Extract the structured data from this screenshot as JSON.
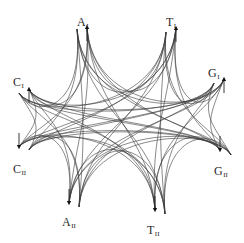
{
  "diagram": {
    "type": "network-of-curved-connections",
    "stroke_color": "#3a3a3a",
    "background": "#ffffff",
    "nodes": [
      {
        "id": "A_I",
        "base": "A",
        "sub": "I",
        "x": 77,
        "y": 16,
        "arrow": {
          "x": 87,
          "y": 27,
          "dir": "up"
        },
        "stem_top": {
          "x": 77,
          "y": 29
        }
      },
      {
        "id": "T_I",
        "base": "T",
        "sub": "I",
        "x": 166,
        "y": 16,
        "arrow": {
          "x": 176,
          "y": 28,
          "dir": "up"
        },
        "stem_top": {
          "x": 166,
          "y": 32
        }
      },
      {
        "id": "C_I",
        "base": "C",
        "sub": "I",
        "x": 13,
        "y": 76,
        "arrow": {
          "x": 29,
          "y": 89,
          "dir": "up"
        },
        "stem_top": {
          "x": 19,
          "y": 93
        }
      },
      {
        "id": "G_I",
        "base": "G",
        "sub": "I",
        "x": 208,
        "y": 67,
        "arrow": {
          "x": 224,
          "y": 79,
          "dir": "up"
        },
        "stem_top": {
          "x": 214,
          "y": 83
        }
      },
      {
        "id": "C_II",
        "base": "C",
        "sub": "II",
        "x": 13,
        "y": 163,
        "arrow": {
          "x": 19,
          "y": 147,
          "dir": "down"
        },
        "stem_bottom": {
          "x": 29,
          "y": 150
        }
      },
      {
        "id": "G_II",
        "base": "G",
        "sub": "II",
        "x": 214,
        "y": 165,
        "arrow": {
          "x": 220,
          "y": 150,
          "dir": "down"
        },
        "stem_bottom": {
          "x": 231,
          "y": 155
        }
      },
      {
        "id": "A_II",
        "base": "A",
        "sub": "II",
        "x": 62,
        "y": 216,
        "arrow": {
          "x": 69,
          "y": 203,
          "dir": "down"
        },
        "stem_bottom": {
          "x": 79,
          "y": 207
        }
      },
      {
        "id": "T_II",
        "base": "T",
        "sub": "II",
        "x": 147,
        "y": 224,
        "arrow": {
          "x": 155,
          "y": 210,
          "dir": "down"
        },
        "stem_bottom": {
          "x": 165,
          "y": 214
        }
      }
    ]
  }
}
